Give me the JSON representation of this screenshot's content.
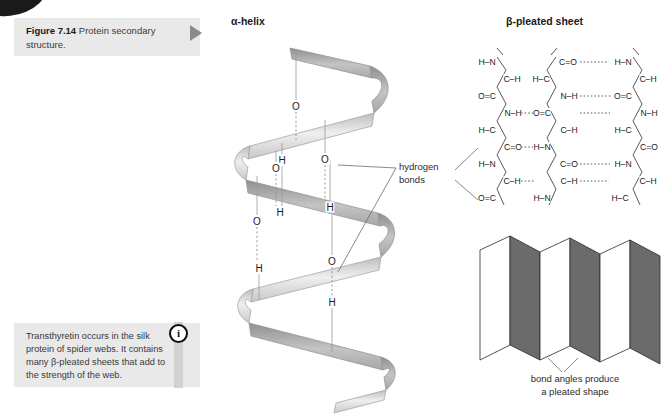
{
  "figure": {
    "number": "Figure 7.14",
    "caption": "Protein secondary structure.",
    "arrow_icon": "play-triangle-icon"
  },
  "note": {
    "icon": "info-icon",
    "icon_glyph": "i",
    "text": "Transthyretin occurs in the silk protein of spider webs. It contains many β-pleated sheets that add to the strength of the web."
  },
  "panels": {
    "alpha_helix_title": "α-helix",
    "beta_sheet_title": "β-pleated sheet"
  },
  "annotations": {
    "hydrogen_bonds_line1": "hydrogen",
    "hydrogen_bonds_line2": "bonds",
    "pleat_caption_line1": "bond angles produce",
    "pleat_caption_line2": "a pleated shape"
  },
  "helix_atoms": [
    {
      "label": "O",
      "x": 296,
      "y": 106
    },
    {
      "label": "H",
      "x": 282,
      "y": 160
    },
    {
      "label": "O",
      "x": 325,
      "y": 159
    },
    {
      "label": "O",
      "x": 276,
      "y": 168
    },
    {
      "label": "H",
      "x": 280,
      "y": 212
    },
    {
      "label": "H",
      "x": 330,
      "y": 207
    },
    {
      "label": "O",
      "x": 257,
      "y": 221
    },
    {
      "label": "O",
      "x": 332,
      "y": 261
    },
    {
      "label": "H",
      "x": 259,
      "y": 268
    },
    {
      "label": "H",
      "x": 332,
      "y": 302
    }
  ],
  "beta_sheet_atoms": [
    {
      "t": "H–N",
      "x": 487,
      "y": 62
    },
    {
      "t": "C–H",
      "x": 508,
      "y": 79
    },
    {
      "t": "O=C",
      "x": 487,
      "y": 96
    },
    {
      "t": "N–H",
      "x": 509,
      "y": 113
    },
    {
      "t": "H–C",
      "x": 487,
      "y": 130
    },
    {
      "t": "C=O",
      "x": 509,
      "y": 147
    },
    {
      "t": "H–N",
      "x": 487,
      "y": 164
    },
    {
      "t": "C–H",
      "x": 508,
      "y": 181
    },
    {
      "t": "O=C",
      "x": 487,
      "y": 198
    },
    {
      "t": "C=O",
      "x": 566,
      "y": 62
    },
    {
      "t": "H–C",
      "x": 545,
      "y": 79
    },
    {
      "t": "N–H",
      "x": 567,
      "y": 96
    },
    {
      "t": "O=C",
      "x": 546,
      "y": 113
    },
    {
      "t": "C–H",
      "x": 567,
      "y": 130
    },
    {
      "t": "H–N",
      "x": 546,
      "y": 147
    },
    {
      "t": "C=O",
      "x": 567,
      "y": 164
    },
    {
      "t": "C–H",
      "x": 567,
      "y": 181
    },
    {
      "t": "H–N",
      "x": 546,
      "y": 198
    },
    {
      "t": "H–N",
      "x": 623,
      "y": 62
    },
    {
      "t": "C–H",
      "x": 644,
      "y": 79
    },
    {
      "t": "O=C",
      "x": 623,
      "y": 96
    },
    {
      "t": "N–H",
      "x": 645,
      "y": 113
    },
    {
      "t": "H–C",
      "x": 623,
      "y": 130
    },
    {
      "t": "C=O",
      "x": 645,
      "y": 147
    },
    {
      "t": "H–N",
      "x": 623,
      "y": 164
    },
    {
      "t": "C–H",
      "x": 644,
      "y": 181
    },
    {
      "t": "H–C",
      "x": 620,
      "y": 198
    },
    {
      "t": "C=O",
      "x": 645,
      "y": 207
    }
  ],
  "colors": {
    "box_bg": "#e9e9e9",
    "bar_gray": "#d2d2d2",
    "ribbon_light": "#d8d8d8",
    "ribbon_dark": "#9a9a9a",
    "pleat_dark": "#6b6b6b",
    "pleat_light": "#ffffff",
    "text": "#231f20",
    "arrow_gray": "#8a8a8a"
  }
}
